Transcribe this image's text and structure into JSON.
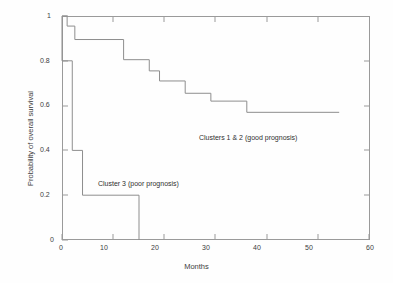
{
  "chart_data": {
    "type": "line",
    "subtype": "kaplan-meier-step",
    "title": "",
    "xlabel": "Months",
    "ylabel": "Probability of overall survival",
    "xlim": [
      0,
      60
    ],
    "ylim": [
      0,
      1
    ],
    "xticks": [
      0,
      10,
      20,
      30,
      40,
      50,
      60
    ],
    "xtick_labels": [
      "0",
      "10",
      "20",
      "30",
      "40",
      "50",
      "60"
    ],
    "yticks": [
      0,
      0.2,
      0.4,
      0.6,
      0.8,
      1
    ],
    "ytick_labels": [
      "0",
      "0.2",
      "0.4",
      "0.6",
      "0.8",
      "1"
    ],
    "grid": false,
    "legend": "none",
    "line_color": "#8a8a8a",
    "frame_color": "#9a9a9a",
    "background": "#ffffff",
    "series": [
      {
        "name": "Clusters 1 & 2 (good prognosis)",
        "annotation": "Clusters 1 & 2 (good prognosis)",
        "annotation_x": 32,
        "annotation_y": 0.53,
        "x": [
          0,
          1,
          1,
          2.5,
          2.5,
          12,
          12,
          17,
          17,
          19,
          19,
          24,
          24,
          29,
          29,
          36,
          36,
          54
        ],
        "y": [
          1,
          1,
          0.955,
          0.955,
          0.895,
          0.895,
          0.805,
          0.805,
          0.755,
          0.755,
          0.71,
          0.71,
          0.655,
          0.655,
          0.62,
          0.62,
          0.57,
          0.57
        ],
        "steps": [
          {
            "month": 0,
            "survival": 1
          },
          {
            "month": 1,
            "survival": 0.955
          },
          {
            "month": 2.5,
            "survival": 0.895
          },
          {
            "month": 12,
            "survival": 0.805
          },
          {
            "month": 17,
            "survival": 0.755
          },
          {
            "month": 19,
            "survival": 0.71
          },
          {
            "month": 24,
            "survival": 0.655
          },
          {
            "month": 29,
            "survival": 0.62
          },
          {
            "month": 36,
            "survival": 0.57
          },
          {
            "month": 54,
            "survival": 0.57
          }
        ]
      },
      {
        "name": "Cluster 3 (poor prognosis)",
        "annotation": "Cluster 3 (poor prognosis)",
        "annotation_x": 8.5,
        "annotation_y": 0.28,
        "x": [
          0,
          0,
          2,
          2,
          4,
          4,
          15,
          15
        ],
        "y": [
          1,
          0.8,
          0.8,
          0.4,
          0.4,
          0.2,
          0.2,
          0
        ],
        "steps": [
          {
            "month": 0,
            "survival": 0.8
          },
          {
            "month": 2,
            "survival": 0.4
          },
          {
            "month": 4,
            "survival": 0.2
          },
          {
            "month": 15,
            "survival": 0
          }
        ]
      }
    ]
  }
}
